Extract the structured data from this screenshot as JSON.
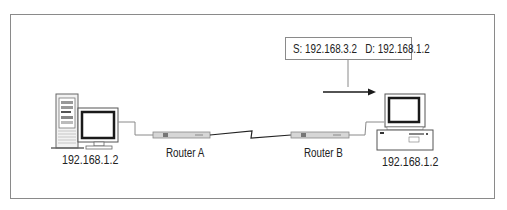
{
  "diagram": {
    "type": "network-topology",
    "nodes": [
      {
        "id": "host-left",
        "kind": "desktop-tower-pc",
        "label": "192.168.1.2"
      },
      {
        "id": "router-a",
        "kind": "router",
        "label": "Router A"
      },
      {
        "id": "router-b",
        "kind": "router",
        "label": "Router B"
      },
      {
        "id": "host-right",
        "kind": "desktop-pc",
        "label": "192.168.1.2"
      }
    ],
    "links": [
      {
        "from": "host-left",
        "to": "router-a",
        "style": "ethernet"
      },
      {
        "from": "router-a",
        "to": "router-b",
        "style": "serial-wan-lightning"
      },
      {
        "from": "router-b",
        "to": "host-right",
        "style": "ethernet"
      }
    ],
    "packet": {
      "source_label": "S: 192.168.3.2",
      "destination_label": "D: 192.168.1.2",
      "direction": "toward host-right",
      "arrow_icon": "arrow-right-icon"
    },
    "colors": {
      "frame": "#8a8a8a",
      "line": "#8a8a8a",
      "wan_line": "#222222",
      "router_fill": "#d4d4d4",
      "screen": "#1a1a1a",
      "text": "#222222"
    }
  }
}
